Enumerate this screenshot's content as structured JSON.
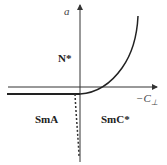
{
  "diagram": {
    "type": "phase-diagram",
    "axes": {
      "y_label": "a",
      "x_label": "−C",
      "x_label_subscript": "⊥"
    },
    "regions": [
      {
        "id": "n-star",
        "label": "N*"
      },
      {
        "id": "sma",
        "label": "SmA"
      },
      {
        "id": "smc-star",
        "label": "SmC*"
      }
    ],
    "colors": {
      "line": "#222222",
      "axis": "#333333"
    }
  }
}
